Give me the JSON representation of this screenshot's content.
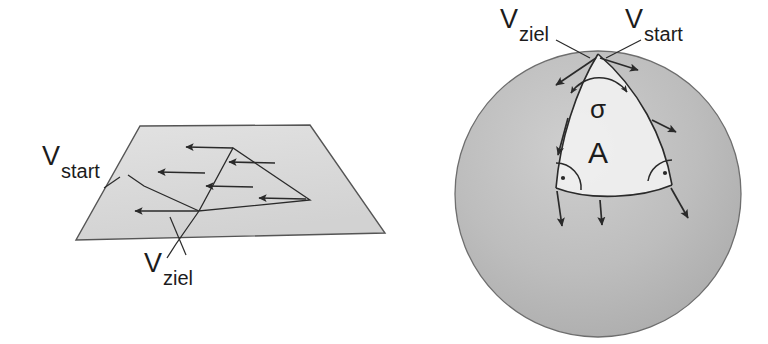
{
  "figure": {
    "background_color": "#ffffff",
    "ink_color": "#2a2a2a",
    "panels": [
      {
        "id": "plane-panel",
        "name": "flat-plane-parallel-transport",
        "surface": "plane",
        "surface_fill": "#dcdcdc",
        "labels": [
          {
            "id": "plane-v-start",
            "main": "V",
            "sub": "start",
            "x": 42,
            "y": 160
          },
          {
            "id": "plane-v-ziel",
            "main": "V",
            "sub": "ziel",
            "x": 144,
            "y": 272
          }
        ],
        "vector_count": 5,
        "closed_loop": true,
        "holonomy": "none"
      },
      {
        "id": "sphere-panel",
        "name": "spherical-triangle-parallel-transport",
        "surface": "sphere",
        "surface_fill": "#b8b8b8",
        "patch_fill": "#efefef",
        "labels": [
          {
            "id": "sphere-v-ziel",
            "main": "V",
            "sub": "ziel",
            "x": 500,
            "y": 30
          },
          {
            "id": "sphere-v-start",
            "main": "V",
            "sub": "start",
            "x": 625,
            "y": 30
          },
          {
            "id": "angle-sigma",
            "main": "σ",
            "sub": "",
            "x": 592,
            "y": 102
          },
          {
            "id": "area-a",
            "main": "A",
            "sub": "",
            "x": 593,
            "y": 152
          }
        ],
        "right_angle_markers": 2,
        "vector_count": 6,
        "holonomy": "sigma"
      }
    ]
  }
}
